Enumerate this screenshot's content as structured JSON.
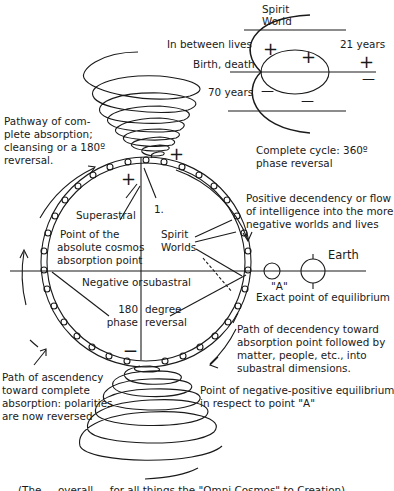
{
  "diagram": {
    "type": "cosmic-cycle-diagram",
    "inset": {
      "labels": {
        "spirit_world_1": "Spirit",
        "spirit_world_2": "World",
        "in_between": "In between lives",
        "birth_death": "Birth, death",
        "seventy": "70 years",
        "twentyone": "21 years",
        "cycle_1": "Complete cycle: 360º",
        "cycle_2": "phase reversal"
      },
      "signs": {
        "plus": "+",
        "minus": "—"
      }
    },
    "upper_spiral": {
      "label_lines": [
        "Pathway of com-",
        "plete absorption;",
        "cleansing or a 180º",
        "revrersal."
      ]
    },
    "circle": {
      "superastral": "Superastral",
      "point_one": "1.",
      "absolute_point": [
        "Point of the",
        "absolute cosmos",
        "absorption point"
      ],
      "spirit_worlds": [
        "Spirit",
        "Worlds"
      ],
      "negative_or": "Negative or",
      "subastral": "subastral",
      "phase_left": [
        "180",
        "phase"
      ],
      "phase_right": [
        "degree",
        "reversal"
      ],
      "plus": "+",
      "minus": "—"
    },
    "right_side": {
      "positive_decendency": [
        "Positive decendency or flow",
        "of intelligence into the more",
        "negative worlds and lives"
      ],
      "earth": "Earth",
      "point_a": "\"A\"",
      "equilibrium": "Exact point of equilibrium",
      "path_decendency": [
        "Path of decendency toward",
        "absorption point followed by",
        "matter, people, etc., into",
        "subastral dimensions."
      ],
      "neg_pos_equilibrium": [
        "Point of negative-positive equilibrium",
        "in respect to point \"A\""
      ]
    },
    "lower_left": {
      "path_ascendency": [
        "Path of ascendency",
        "toward complete",
        "absorption: polarities",
        "are now reversed"
      ]
    },
    "caption": "(The ... overall ... for all things the \"Omni Cosmos\" to Creation)",
    "colors": {
      "ink": "#1a1a1a",
      "background": "#ffffff"
    }
  }
}
